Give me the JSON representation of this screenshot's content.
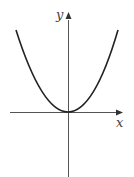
{
  "diagram": {
    "title": "",
    "type": "function-graph",
    "function": "parabola opening upward with vertex at origin",
    "axes": {
      "x_label": "x",
      "y_label": "y"
    },
    "colors": {
      "curve": "#222222",
      "axis": "#555555",
      "background": "#ffffff"
    }
  }
}
